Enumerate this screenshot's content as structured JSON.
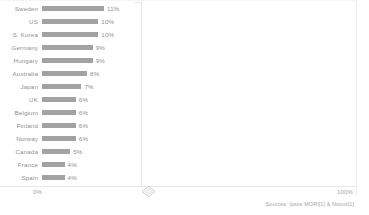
{
  "chart_data": {
    "type": "bar",
    "orientation": "horizontal",
    "title": "",
    "xlabel": "",
    "ylabel": "",
    "xlim": [
      0,
      100
    ],
    "grid": false,
    "legend": null,
    "axis_ticks": {
      "left_label": "0%",
      "right_label": "100%"
    },
    "categories": [
      "Sweden",
      "US",
      "S. Korea",
      "Germany",
      "Hungary",
      "Australia",
      "Japan",
      "UK",
      "Belgium",
      "Finland",
      "Norway",
      "Canada",
      "France",
      "Spain"
    ],
    "values": [
      11,
      10,
      10,
      9,
      9,
      8,
      7,
      6,
      6,
      6,
      6,
      5,
      4,
      4
    ],
    "value_labels": [
      "11%",
      "10%",
      "10%",
      "9%",
      "9%",
      "8%",
      "7%",
      "6%",
      "6%",
      "6%",
      "6%",
      "5%",
      "4%",
      "4%"
    ],
    "bar_color": "#a2a2a2",
    "axis_color": "#e8e8e8",
    "text_color": "#8f8f8f"
  },
  "footer": {
    "source": "Sources: Ipsos MORI[1] & Novus[1]"
  },
  "controls": {
    "resize_handle": "diamond-handle"
  }
}
